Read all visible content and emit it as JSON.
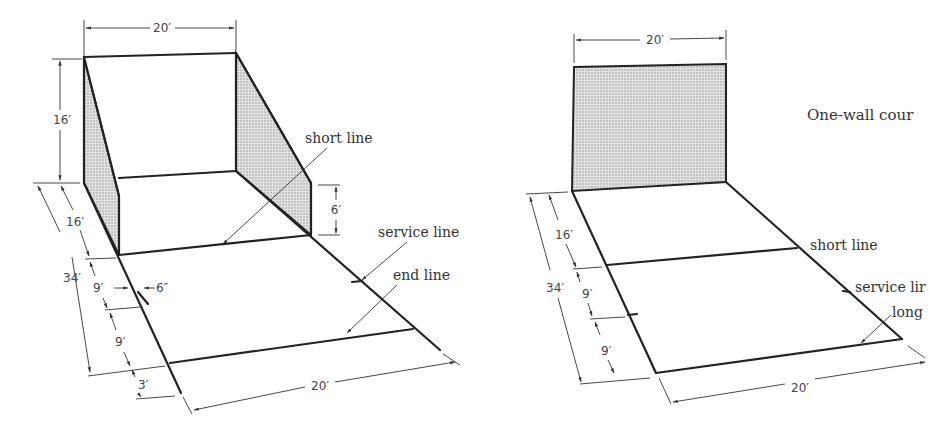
{
  "four_wall_court": {
    "labels": {
      "short_line": "short line",
      "service_line": "service line",
      "end_line": "end line"
    },
    "dimensions": {
      "front_wall_width": "20′",
      "front_wall_height": "16′",
      "side_wall_back_height": "6′",
      "front_to_short": "16′",
      "total_length": "34′",
      "short_to_service": "9′",
      "service_box": "6″",
      "service_to_end": "9′",
      "beyond_end": "3′",
      "floor_width": "20′"
    }
  },
  "one_wall_court": {
    "caption": "One-wall cour",
    "labels": {
      "short_line": "short line",
      "service_line": "service lir",
      "long_line": "long"
    },
    "dimensions": {
      "wall_width": "20′",
      "front_to_short": "16′",
      "total_length": "34′",
      "short_to_service": "9′",
      "service_to_long": "9′",
      "floor_width": "20′"
    }
  }
}
